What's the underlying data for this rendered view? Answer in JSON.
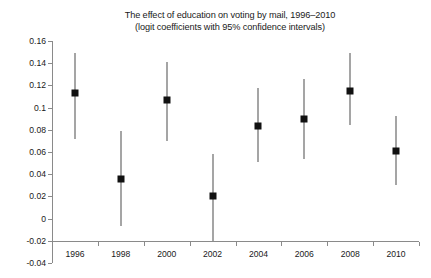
{
  "chart_data": {
    "type": "scatter",
    "title": "The effect of education on voting by mail, 1996–2010",
    "subtitle": "(logit coefficients with 95% confidence intervals)",
    "xlabel": "",
    "ylabel": "",
    "grid": false,
    "legend": "none",
    "xlim": [
      1995,
      2011
    ],
    "ylim": [
      -0.04,
      0.16
    ],
    "x": [
      1996,
      1998,
      2000,
      2002,
      2004,
      2006,
      2008,
      2010
    ],
    "categories": [
      "1996",
      "1998",
      "2000",
      "2002",
      "2004",
      "2006",
      "2008",
      "2010"
    ],
    "xticklabels": [
      "1996",
      "1998",
      "2000",
      "2002",
      "2004",
      "2006",
      "2008",
      "2010"
    ],
    "yticklabels": [
      "0.16",
      "0.14",
      "0.12",
      "0.1",
      "0.08",
      "0.06",
      "0.04",
      "0.02",
      "0",
      "-0.02",
      "-0.04"
    ],
    "ytickvalues": [
      0.16,
      0.14,
      0.12,
      0.1,
      0.08,
      0.06,
      0.04,
      0.02,
      0,
      -0.02,
      -0.04
    ],
    "series": [
      {
        "name": "logit coefficient",
        "values": [
          0.113,
          0.036,
          0.107,
          0.02,
          0.083,
          0.09,
          0.115,
          0.061
        ],
        "ci_low": [
          0.072,
          -0.007,
          0.07,
          -0.02,
          0.051,
          0.054,
          0.084,
          0.03
        ],
        "ci_high": [
          0.149,
          0.079,
          0.141,
          0.058,
          0.118,
          0.126,
          0.149,
          0.092
        ]
      }
    ],
    "marker": "square",
    "marker_color": "#111111",
    "errorbar_color": "#4d4d4d",
    "axis_color": "#8a8a8a"
  }
}
